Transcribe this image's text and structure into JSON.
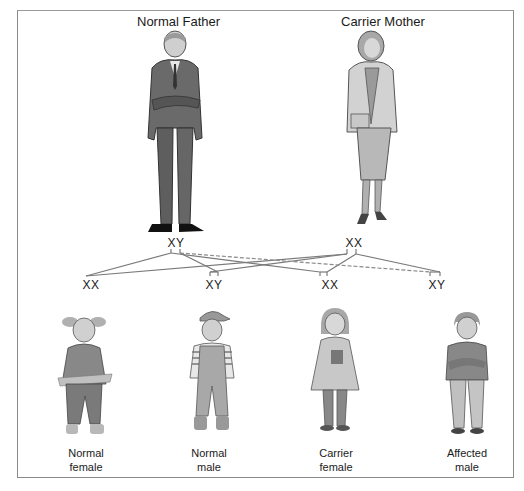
{
  "parents": {
    "father": {
      "title": "Normal Father",
      "genotype": "XY"
    },
    "mother": {
      "title": "Carrier Mother",
      "genotype": "XX"
    }
  },
  "offspring": [
    {
      "genotype": "XX",
      "label_line1": "Normal",
      "label_line2": "female"
    },
    {
      "genotype": "XY",
      "label_line1": "Normal",
      "label_line2": "male"
    },
    {
      "genotype": "XX",
      "label_line1": "Carrier",
      "label_line2": "female"
    },
    {
      "genotype": "XY",
      "label_line1": "Affected",
      "label_line2": "male"
    }
  ],
  "colors": {
    "line": "#7a7a7a",
    "frame": "#8a8a8a",
    "figure_dark": "#4a4a4a",
    "figure_mid": "#8c8c8c",
    "figure_light": "#c4c4c4"
  }
}
